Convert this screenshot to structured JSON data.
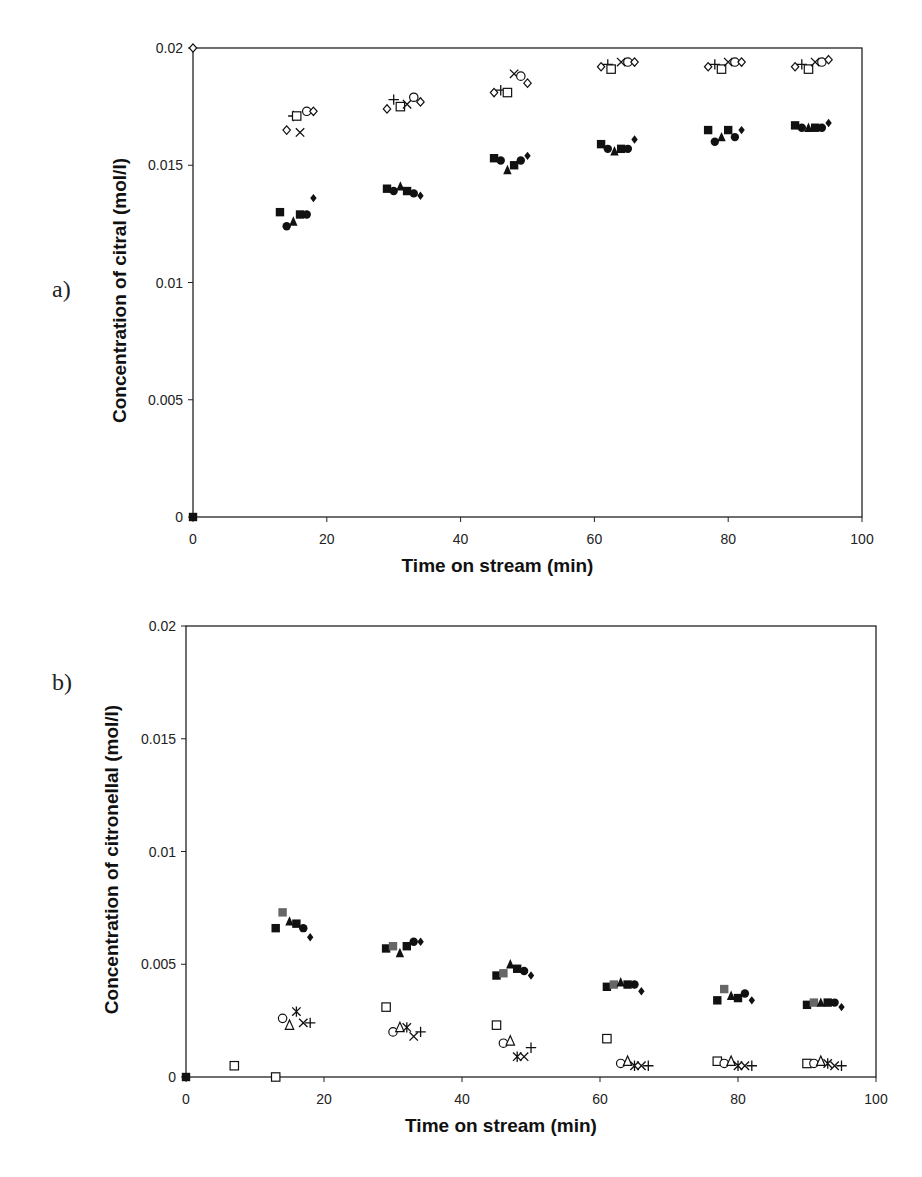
{
  "chart_data": [
    {
      "panel_label": "a)",
      "type": "scatter",
      "title": "",
      "xlabel": "Time on stream (min)",
      "ylabel": "Concentration of citral (mol/l)",
      "xlim": [
        0,
        100
      ],
      "ylim": [
        0,
        0.02
      ],
      "xticks": [
        "0",
        "20",
        "40",
        "60",
        "80",
        "100"
      ],
      "yticks": [
        "0",
        "0.005",
        "0.01",
        "0.015",
        "0.02"
      ],
      "grid": false,
      "legend": null,
      "series": [
        {
          "name": "open diamond",
          "marker": "diamond-open",
          "points": [
            [
              0,
              0.02
            ],
            [
              14,
              0.0165
            ],
            [
              29,
              0.0174
            ],
            [
              45,
              0.0181
            ],
            [
              61,
              0.0192
            ],
            [
              77,
              0.0192
            ],
            [
              90,
              0.0192
            ]
          ]
        },
        {
          "name": "plus",
          "marker": "plus",
          "points": [
            [
              15,
              0.0171
            ],
            [
              30,
              0.0178
            ],
            [
              46,
              0.0182
            ],
            [
              62,
              0.0193
            ],
            [
              78,
              0.0193
            ],
            [
              91,
              0.0193
            ]
          ]
        },
        {
          "name": "open square",
          "marker": "square-open",
          "points": [
            [
              15.5,
              0.0171
            ],
            [
              31,
              0.0175
            ],
            [
              47,
              0.0181
            ],
            [
              62.5,
              0.0191
            ],
            [
              79,
              0.0191
            ],
            [
              92,
              0.0191
            ]
          ]
        },
        {
          "name": "cross",
          "marker": "x",
          "points": [
            [
              16,
              0.0164
            ],
            [
              32,
              0.0176
            ],
            [
              48,
              0.0189
            ],
            [
              64,
              0.0194
            ],
            [
              80,
              0.0194
            ],
            [
              93,
              0.0194
            ]
          ]
        },
        {
          "name": "open circle",
          "marker": "circle-open",
          "points": [
            [
              17,
              0.0173
            ],
            [
              33,
              0.0179
            ],
            [
              49,
              0.0188
            ],
            [
              65,
              0.0194
            ],
            [
              81,
              0.0194
            ],
            [
              94,
              0.0194
            ]
          ]
        },
        {
          "name": "open diamond 2",
          "marker": "diamond-open",
          "points": [
            [
              18,
              0.0173
            ],
            [
              34,
              0.0177
            ],
            [
              50,
              0.0185
            ],
            [
              66,
              0.0194
            ],
            [
              82,
              0.0194
            ],
            [
              95,
              0.0195
            ]
          ]
        },
        {
          "name": "filled square",
          "marker": "square",
          "points": [
            [
              0,
              0
            ],
            [
              13,
              0.013
            ],
            [
              29,
              0.014
            ],
            [
              45,
              0.0153
            ],
            [
              61,
              0.0159
            ],
            [
              77,
              0.0165
            ],
            [
              90,
              0.0167
            ]
          ]
        },
        {
          "name": "filled circle",
          "marker": "circle",
          "points": [
            [
              14,
              0.0124
            ],
            [
              30,
              0.0139
            ],
            [
              46,
              0.0152
            ],
            [
              62,
              0.0157
            ],
            [
              78,
              0.016
            ],
            [
              91,
              0.0166
            ]
          ]
        },
        {
          "name": "filled triangle",
          "marker": "triangle",
          "points": [
            [
              15,
              0.0126
            ],
            [
              31,
              0.0141
            ],
            [
              47,
              0.0148
            ],
            [
              63,
              0.0156
            ],
            [
              79,
              0.0162
            ],
            [
              92,
              0.0166
            ]
          ]
        },
        {
          "name": "filled square 2",
          "marker": "square",
          "points": [
            [
              16,
              0.0129
            ],
            [
              32,
              0.0139
            ],
            [
              48,
              0.015
            ],
            [
              64,
              0.0157
            ],
            [
              80,
              0.0165
            ],
            [
              93,
              0.0166
            ]
          ]
        },
        {
          "name": "filled circle 2",
          "marker": "circle",
          "points": [
            [
              17,
              0.0129
            ],
            [
              33,
              0.0138
            ],
            [
              49,
              0.0152
            ],
            [
              65,
              0.0157
            ],
            [
              81,
              0.0162
            ],
            [
              94,
              0.0166
            ]
          ]
        },
        {
          "name": "filled diamond",
          "marker": "diamond",
          "points": [
            [
              18,
              0.0136
            ],
            [
              34,
              0.0137
            ],
            [
              50,
              0.0154
            ],
            [
              66,
              0.0161
            ],
            [
              82,
              0.0165
            ],
            [
              95,
              0.0168
            ]
          ]
        }
      ]
    },
    {
      "panel_label": "b)",
      "type": "scatter",
      "title": "",
      "xlabel": "Time on stream (min)",
      "ylabel": "Concentration of citronellal (mol/l)",
      "xlim": [
        0,
        100
      ],
      "ylim": [
        0,
        0.02
      ],
      "xticks": [
        "0",
        "20",
        "40",
        "60",
        "80",
        "100"
      ],
      "yticks": [
        "0",
        "0.005",
        "0.01",
        "0.015",
        "0.02"
      ],
      "grid": false,
      "legend": null,
      "series": [
        {
          "name": "filled square",
          "marker": "square",
          "points": [
            [
              0,
              0
            ],
            [
              13,
              0.0066
            ],
            [
              29,
              0.0057
            ],
            [
              45,
              0.0045
            ],
            [
              61,
              0.004
            ],
            [
              77,
              0.0034
            ],
            [
              90,
              0.0032
            ]
          ]
        },
        {
          "name": "gray square",
          "marker": "square-gray",
          "points": [
            [
              14,
              0.0073
            ],
            [
              30,
              0.0058
            ],
            [
              46,
              0.0046
            ],
            [
              62,
              0.0041
            ],
            [
              78,
              0.0039
            ],
            [
              91,
              0.0033
            ]
          ]
        },
        {
          "name": "filled triangle",
          "marker": "triangle",
          "points": [
            [
              15,
              0.0069
            ],
            [
              31,
              0.0055
            ],
            [
              47,
              0.005
            ],
            [
              63,
              0.0042
            ],
            [
              79,
              0.0036
            ],
            [
              92,
              0.0033
            ]
          ]
        },
        {
          "name": "filled square 2",
          "marker": "square",
          "points": [
            [
              16,
              0.0068
            ],
            [
              32,
              0.0058
            ],
            [
              48,
              0.0048
            ],
            [
              64,
              0.0041
            ],
            [
              80,
              0.0035
            ],
            [
              93,
              0.0033
            ]
          ]
        },
        {
          "name": "filled circle",
          "marker": "circle",
          "points": [
            [
              17,
              0.0066
            ],
            [
              33,
              0.006
            ],
            [
              49,
              0.0047
            ],
            [
              65,
              0.0041
            ],
            [
              81,
              0.0037
            ],
            [
              94,
              0.0033
            ]
          ]
        },
        {
          "name": "filled diamond",
          "marker": "diamond",
          "points": [
            [
              18,
              0.0062
            ],
            [
              34,
              0.006
            ],
            [
              50,
              0.0045
            ],
            [
              66,
              0.0038
            ],
            [
              82,
              0.0034
            ],
            [
              95,
              0.0031
            ]
          ]
        },
        {
          "name": "open square",
          "marker": "square-open",
          "points": [
            [
              7,
              0.0005
            ],
            [
              13,
              0.0
            ],
            [
              29,
              0.0031
            ],
            [
              45,
              0.0023
            ],
            [
              61,
              0.0017
            ],
            [
              77,
              0.0007
            ],
            [
              90,
              0.0006
            ]
          ]
        },
        {
          "name": "open circle",
          "marker": "circle-open",
          "points": [
            [
              14,
              0.0026
            ],
            [
              30,
              0.002
            ],
            [
              46,
              0.0015
            ],
            [
              63,
              0.0006
            ],
            [
              78,
              0.0006
            ],
            [
              91,
              0.0006
            ]
          ]
        },
        {
          "name": "open triangle",
          "marker": "triangle-open",
          "points": [
            [
              15,
              0.0023
            ],
            [
              31,
              0.0022
            ],
            [
              47,
              0.0016
            ],
            [
              64,
              0.0007
            ],
            [
              79,
              0.0007
            ],
            [
              92,
              0.0007
            ]
          ]
        },
        {
          "name": "asterisk",
          "marker": "asterisk",
          "points": [
            [
              16,
              0.0029
            ],
            [
              32,
              0.0022
            ],
            [
              48,
              0.0009
            ],
            [
              65,
              0.0005
            ],
            [
              80,
              0.0005
            ],
            [
              93,
              0.0006
            ]
          ]
        },
        {
          "name": "cross",
          "marker": "x",
          "points": [
            [
              17,
              0.0024
            ],
            [
              33,
              0.0018
            ],
            [
              49,
              0.0009
            ],
            [
              66,
              0.0005
            ],
            [
              81,
              0.0005
            ],
            [
              94,
              0.0005
            ]
          ]
        },
        {
          "name": "plus",
          "marker": "plus",
          "points": [
            [
              18,
              0.0024
            ],
            [
              34,
              0.002
            ],
            [
              50,
              0.0013
            ],
            [
              67,
              0.0005
            ],
            [
              82,
              0.0005
            ],
            [
              95,
              0.0005
            ]
          ]
        }
      ]
    }
  ],
  "panels": [
    {
      "label": "a)",
      "xlabel": "Time on stream (min)",
      "ylabel": "Concentration of citral (mol/l)"
    },
    {
      "label": "b)",
      "xlabel": "Time on stream (min)",
      "ylabel": "Concentration of citronellal (mol/l)"
    }
  ]
}
